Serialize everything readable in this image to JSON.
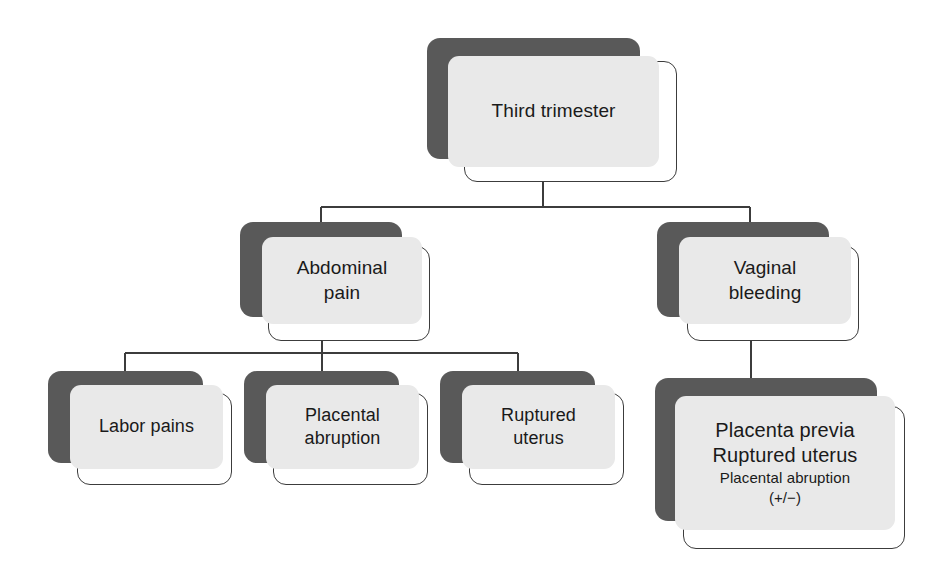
{
  "diagram": {
    "colors": {
      "shadow": "#595959",
      "fill": "#e9e9e9",
      "outline": "#3c3c3c",
      "background": "#ffffff",
      "text": "#1a1a1a",
      "connector": "#3c3c3c"
    },
    "nodes": {
      "root": {
        "label": "Third trimester"
      },
      "branch_left": {
        "label": "Abdominal\npain"
      },
      "branch_right": {
        "label": "Vaginal\nbleeding"
      },
      "leaf_labor_pains": {
        "label": "Labor pains"
      },
      "leaf_placental_abruption": {
        "label": "Placental\nabruption"
      },
      "leaf_ruptured_uterus": {
        "label": "Ruptured\nuterus"
      },
      "leaf_bleeding_causes": {
        "line1": "Placenta previa",
        "line2": "Ruptured uterus",
        "line3": "Placental abruption",
        "line4": "(+/−)"
      }
    }
  }
}
